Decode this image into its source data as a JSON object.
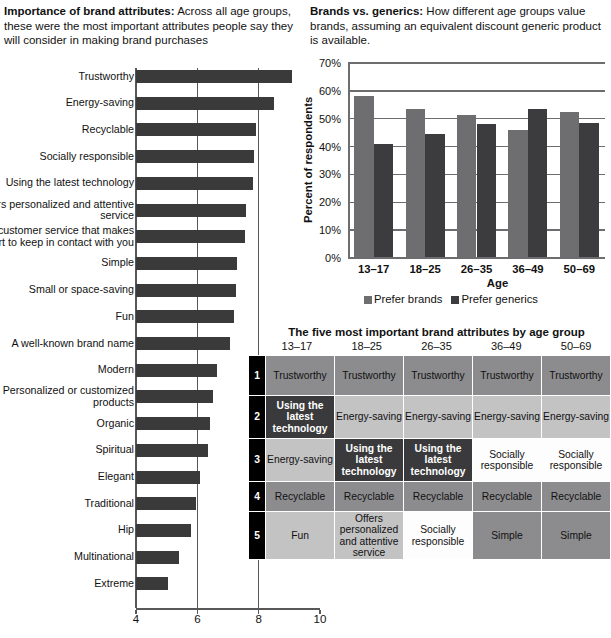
{
  "left_panel": {
    "heading_bold": "Importance of brand attributes:",
    "heading_body": "Across all age groups, these were the most important attributes people say they will consider in making brand purchases"
  },
  "right_panel": {
    "heading_bold": "Brands vs. generics:",
    "heading_body": " How different age groups value brands, assuming an equivalent discount generic product is available."
  },
  "chart_data": [
    {
      "type": "bar",
      "orientation": "horizontal",
      "title": "Importance of brand attributes",
      "xlabel": "",
      "ylabel": "",
      "xlim": [
        4,
        10
      ],
      "xticks": [
        "4",
        "6",
        "8",
        "10"
      ],
      "xtick_values": [
        4,
        6,
        8,
        10
      ],
      "grid": true,
      "bar_color": "#3a3a3a",
      "categories": [
        "Trustworthy",
        "Energy-saving",
        "Recyclable",
        "Socially responsible",
        "Using the latest technology",
        "Offers personalized and attentive service",
        "Offers customer service that makes an effort to keep in contact with you",
        "Simple",
        "Small or space-saving",
        "Fun",
        "A well-known brand name",
        "Modern",
        "Personalized or customized products",
        "Organic",
        "Spiritual",
        "Elegant",
        "Traditional",
        "Hip",
        "Multinational",
        "Extreme"
      ],
      "values": [
        9.1,
        8.5,
        7.9,
        7.85,
        7.8,
        7.6,
        7.55,
        7.3,
        7.25,
        7.2,
        7.05,
        6.65,
        6.5,
        6.4,
        6.35,
        6.1,
        5.95,
        5.8,
        5.4,
        5.05
      ]
    },
    {
      "type": "bar",
      "title": "Brands vs. generics",
      "xlabel": "Age",
      "ylabel": "Percent of respondents",
      "categories": [
        "13–17",
        "18–25",
        "26–35",
        "36–49",
        "50–69"
      ],
      "yticks": [
        "0%",
        "10%",
        "20%",
        "30%",
        "40%",
        "50%",
        "60%",
        "70%"
      ],
      "ytick_values": [
        0,
        10,
        20,
        30,
        40,
        50,
        60,
        70
      ],
      "ylim": [
        0,
        70
      ],
      "grid": true,
      "legend_position": "bottom",
      "series": [
        {
          "name": "Prefer brands",
          "color": "#6e6e70",
          "values": [
            58,
            53.5,
            51.5,
            46,
            52.5
          ]
        },
        {
          "name": "Prefer generics",
          "color": "#3c3c3e",
          "values": [
            41,
            44.5,
            48,
            53.5,
            48.5
          ]
        }
      ]
    }
  ],
  "table": {
    "title": "The five most important brand attributes by age group",
    "columns": [
      "13–17",
      "18–25",
      "26–35",
      "36–49",
      "50–69"
    ],
    "row_numbers": [
      "1",
      "2",
      "3",
      "4",
      "5"
    ],
    "rows": [
      [
        {
          "text": "Trustworthy",
          "shade": "mid"
        },
        {
          "text": "Trustworthy",
          "shade": "mid"
        },
        {
          "text": "Trustworthy",
          "shade": "mid"
        },
        {
          "text": "Trustworthy",
          "shade": "mid"
        },
        {
          "text": "Trustworthy",
          "shade": "mid"
        }
      ],
      [
        {
          "text": "Using the latest technology",
          "shade": "dark"
        },
        {
          "text": "Energy-saving",
          "shade": "light"
        },
        {
          "text": "Energy-saving",
          "shade": "light"
        },
        {
          "text": "Energy-saving",
          "shade": "light"
        },
        {
          "text": "Energy-saving",
          "shade": "light"
        }
      ],
      [
        {
          "text": "Energy-saving",
          "shade": "light"
        },
        {
          "text": "Using the latest technology",
          "shade": "dark"
        },
        {
          "text": "Using the latest technology",
          "shade": "dark"
        },
        {
          "text": "Socially responsible",
          "shade": "white"
        },
        {
          "text": "Socially responsible",
          "shade": "white"
        }
      ],
      [
        {
          "text": "Recyclable",
          "shade": "mid"
        },
        {
          "text": "Recyclable",
          "shade": "mid"
        },
        {
          "text": "Recyclable",
          "shade": "mid"
        },
        {
          "text": "Recyclable",
          "shade": "mid"
        },
        {
          "text": "Recyclable",
          "shade": "mid"
        }
      ],
      [
        {
          "text": "Fun",
          "shade": "light"
        },
        {
          "text": "Offers personalized and attentive service",
          "shade": "light"
        },
        {
          "text": "Socially responsible",
          "shade": "white"
        },
        {
          "text": "Simple",
          "shade": "mid"
        },
        {
          "text": "Simple",
          "shade": "mid"
        }
      ]
    ]
  }
}
